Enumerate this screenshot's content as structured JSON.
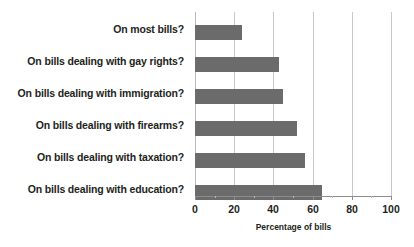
{
  "chart_data": {
    "type": "bar",
    "orientation": "horizontal",
    "title": "",
    "subtitle": "",
    "xlabel": "Percentage of bills",
    "ylabel": "",
    "xlim": [
      0,
      100
    ],
    "xticks": [
      0,
      20,
      40,
      60,
      80,
      100
    ],
    "xticklabels": [
      "0",
      "20",
      "40",
      "60",
      "80",
      "100"
    ],
    "minor_xticks": [
      10,
      30,
      50,
      70,
      90
    ],
    "grid": "vertical",
    "legend": null,
    "bar_color": "#6b6b6b",
    "categories": [
      "On most bills?",
      "On bills dealing with gay rights?",
      "On bills dealing with immigration?",
      "On bills dealing with firearms?",
      "On bills dealing with taxation?",
      "On bills dealing with education?"
    ],
    "values": [
      24,
      43,
      45,
      52,
      56,
      65
    ],
    "series": [
      {
        "name": "Percentage of bills",
        "values": [
          24,
          43,
          45,
          52,
          56,
          65
        ]
      }
    ]
  }
}
